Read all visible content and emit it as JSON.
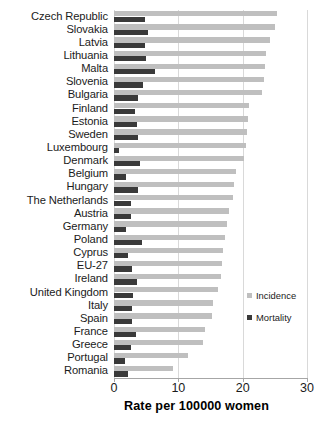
{
  "chart_data": {
    "type": "bar",
    "orientation": "horizontal",
    "title": "",
    "xlabel": "Rate per 100000 women",
    "ylabel": "",
    "xlim": [
      0,
      30
    ],
    "xticks": [
      0,
      10,
      20,
      30
    ],
    "xtick_labels": [
      "0",
      "10",
      "20",
      "30"
    ],
    "grid": true,
    "legend_position": "right",
    "categories": [
      "Czech Republic",
      "Slovakia",
      "Latvia",
      "Lithuania",
      "Malta",
      "Slovenia",
      "Bulgaria",
      "Finland",
      "Estonia",
      "Sweden",
      "Luxembourg",
      "Denmark",
      "Belgium",
      "Hungary",
      "The Netherlands",
      "Austria",
      "Germany",
      "Poland",
      "Cyprus",
      "EU-27",
      "Ireland",
      "United Kingdom",
      "Italy",
      "Spain",
      "France",
      "Greece",
      "Portugal",
      "Romania"
    ],
    "series": [
      {
        "name": "Incidence",
        "color": "#bfbfbf",
        "values": [
          25.3,
          25.0,
          24.3,
          23.6,
          23.4,
          23.3,
          23.0,
          21.0,
          20.8,
          20.6,
          20.5,
          20.2,
          18.9,
          18.6,
          18.5,
          17.8,
          17.5,
          17.3,
          17.0,
          16.8,
          16.6,
          16.2,
          15.4,
          15.3,
          14.2,
          13.8,
          11.5,
          9.2
        ]
      },
      {
        "name": "Mortality",
        "color": "#3a3a3a",
        "values": [
          4.8,
          5.3,
          4.8,
          4.9,
          6.3,
          4.5,
          3.8,
          3.3,
          3.5,
          3.7,
          0.8,
          4.0,
          1.9,
          3.8,
          2.6,
          2.7,
          1.8,
          4.3,
          2.2,
          2.8,
          3.5,
          3.0,
          2.8,
          2.8,
          3.4,
          2.7,
          1.7,
          2.2
        ]
      }
    ]
  },
  "legend": {
    "items": [
      {
        "label": "Incidence",
        "color": "#bfbfbf"
      },
      {
        "label": "Mortality",
        "color": "#3a3a3a"
      }
    ]
  },
  "axis": {
    "x_title": "Rate per 100000 women"
  }
}
